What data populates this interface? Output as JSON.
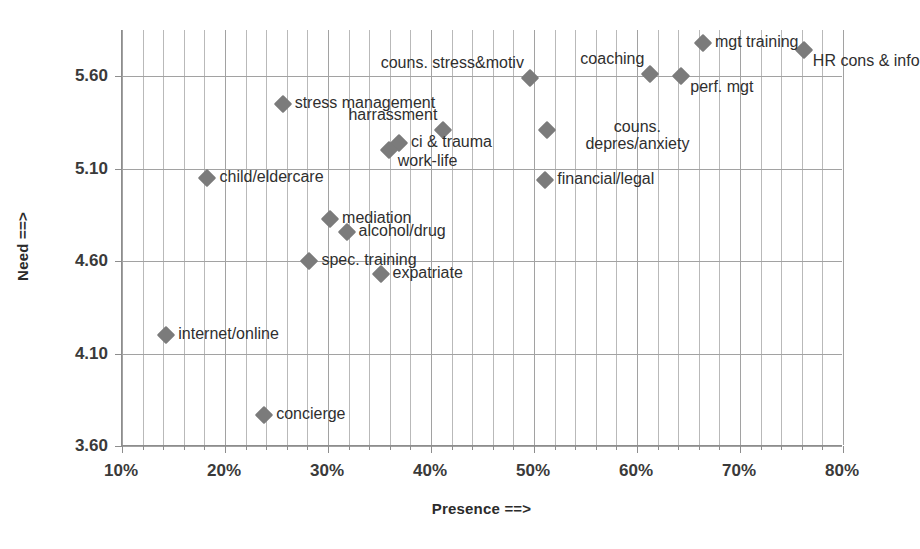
{
  "chart_data": {
    "type": "scatter",
    "title": "",
    "xlabel": "Presence ==>",
    "ylabel": "Need ==>",
    "xlim": [
      0.1,
      0.8
    ],
    "ylim": [
      3.6,
      5.85
    ],
    "xtick_labels": [
      "10%",
      "20%",
      "30%",
      "40%",
      "50%",
      "60%",
      "70%",
      "80%"
    ],
    "xtick_values": [
      10,
      20,
      30,
      40,
      50,
      60,
      70,
      80
    ],
    "ytick_labels": [
      "3.60",
      "4.10",
      "4.60",
      "5.10",
      "5.60"
    ],
    "ytick_values": [
      3.6,
      4.1,
      4.6,
      5.1,
      5.6
    ],
    "grid": "vertical minor every 2% plus horizontal at major y ticks",
    "legend": "none",
    "marker_style": "grey diamond",
    "marker_color": "#7b7b7b",
    "points": [
      {
        "label": "stress management",
        "x": 25.6,
        "y": 5.45,
        "label_pos": "right"
      },
      {
        "label": "harrassment",
        "x": 41.2,
        "y": 5.31,
        "label_pos": "above-left"
      },
      {
        "label": "ci & trauma",
        "x": 36.9,
        "y": 5.24,
        "label_pos": "right"
      },
      {
        "label": "work-life",
        "x": 35.9,
        "y": 5.2,
        "label_pos": "below-left"
      },
      {
        "label": "child/eldercare",
        "x": 18.3,
        "y": 5.05,
        "label_pos": "right"
      },
      {
        "label": "mediation",
        "x": 30.2,
        "y": 4.83,
        "label_pos": "right"
      },
      {
        "label": "alcohol/drug",
        "x": 31.8,
        "y": 4.76,
        "label_pos": "right"
      },
      {
        "label": "spec. training",
        "x": 28.2,
        "y": 4.6,
        "label_pos": "right"
      },
      {
        "label": "expatriate",
        "x": 35.1,
        "y": 4.53,
        "label_pos": "right"
      },
      {
        "label": "internet/online",
        "x": 14.3,
        "y": 4.2,
        "label_pos": "right"
      },
      {
        "label": "concierge",
        "x": 23.8,
        "y": 3.77,
        "label_pos": "right"
      },
      {
        "label": "couns. stress&motiv",
        "x": 49.6,
        "y": 5.59,
        "label_pos": "above-left"
      },
      {
        "label": "coaching",
        "x": 61.3,
        "y": 5.61,
        "label_pos": "above-left"
      },
      {
        "label": "mgt training",
        "x": 66.4,
        "y": 5.78,
        "label_pos": "right"
      },
      {
        "label": "perf. mgt",
        "x": 64.3,
        "y": 5.6,
        "label_pos": "below-left"
      },
      {
        "label": "HR cons & info",
        "x": 76.2,
        "y": 5.74,
        "label_pos": "below-left"
      },
      {
        "label": "couns. depres/anxiety",
        "x": 51.3,
        "y": 5.31,
        "label_pos": "right-two-line"
      },
      {
        "label": "financial/legal",
        "x": 51.1,
        "y": 5.04,
        "label_pos": "right"
      }
    ]
  },
  "axes": {
    "x_title": "Presence ==>",
    "y_title": "Need ==>"
  },
  "labels": {
    "stress_management": "stress management",
    "harrassment": "harrassment",
    "ci_trauma": "ci & trauma",
    "work_life": "work-life",
    "child_eldercare": "child/eldercare",
    "mediation": "mediation",
    "alcohol_drug": "alcohol/drug",
    "spec_training": "spec. training",
    "expatriate": "expatriate",
    "internet_online": "internet/online",
    "concierge": "concierge",
    "couns_stress_motiv": "couns. stress&motiv",
    "coaching": "coaching",
    "mgt_training": "mgt training",
    "perf_mgt": "perf. mgt",
    "hr_cons_info": "HR cons & info",
    "couns_depres_line1": "couns.",
    "couns_depres_line2": "depres/anxiety",
    "financial_legal": "financial/legal"
  }
}
